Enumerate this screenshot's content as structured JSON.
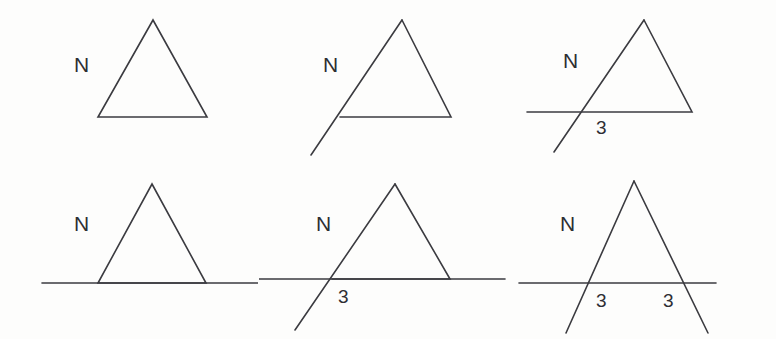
{
  "figure": {
    "background_color": "#fdfdfc",
    "stroke_color": "#3b3b40",
    "text_color": "#2e2e33",
    "width": 776,
    "height": 339,
    "columns": 3,
    "rows": 2
  },
  "panels": [
    {
      "id": "panel-1",
      "position": "top-left",
      "description": "Plain triangle with label N at upper left",
      "labels": {
        "n": "N",
        "three_left": "",
        "three_right": ""
      },
      "has_horizontal_line": false,
      "left_side_extended": false,
      "right_side_extended": false
    },
    {
      "id": "panel-2",
      "position": "top-center",
      "description": "Triangle with left side extended below the base",
      "labels": {
        "n": "N",
        "three_left": "",
        "three_right": ""
      },
      "has_horizontal_line": false,
      "left_side_extended": true,
      "right_side_extended": false
    },
    {
      "id": "panel-3",
      "position": "top-right",
      "description": "Triangle with base extended to the left and left side extended below, intersection labeled 3",
      "labels": {
        "n": "N",
        "three_left": "3",
        "three_right": ""
      },
      "has_horizontal_line": true,
      "left_side_extended": true,
      "right_side_extended": false
    },
    {
      "id": "panel-4",
      "position": "bottom-left",
      "description": "Triangle sitting on a horizontal line extended both directions",
      "labels": {
        "n": "N",
        "three_left": "",
        "three_right": ""
      },
      "has_horizontal_line": true,
      "left_side_extended": false,
      "right_side_extended": false
    },
    {
      "id": "panel-5",
      "position": "bottom-center",
      "description": "Triangle on a horizontal line with left side extended below, intersection labeled 3",
      "labels": {
        "n": "N",
        "three_left": "3",
        "three_right": ""
      },
      "has_horizontal_line": true,
      "left_side_extended": true,
      "right_side_extended": false
    },
    {
      "id": "panel-6",
      "position": "bottom-right",
      "description": "Triangle on a horizontal line with both sides extended below, both intersections labeled 3",
      "labels": {
        "n": "N",
        "three_left": "3",
        "three_right": "3"
      },
      "has_horizontal_line": true,
      "left_side_extended": true,
      "right_side_extended": true
    }
  ]
}
